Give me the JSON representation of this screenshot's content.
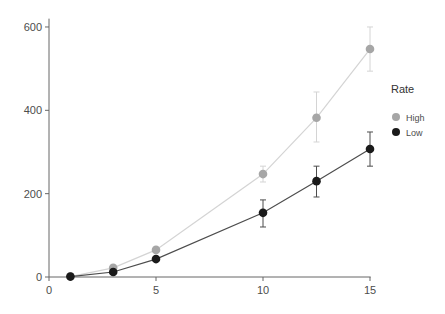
{
  "chart_data": {
    "type": "line",
    "title": "",
    "xlabel": "",
    "ylabel": "",
    "xlim": [
      0,
      15.5
    ],
    "ylim": [
      0,
      620
    ],
    "x_ticks": [
      0,
      5,
      10,
      15
    ],
    "y_ticks": [
      0,
      200,
      400,
      600
    ],
    "grid": false,
    "legend": {
      "title": "Rate",
      "position": "right"
    },
    "x": [
      1,
      3,
      5,
      10,
      12.5,
      15
    ],
    "series": [
      {
        "name": "High",
        "color": "#a6a6a6",
        "line_color": "#d4d4d4",
        "values": [
          1,
          22,
          65,
          247,
          382,
          547
        ],
        "error_low": [
          1,
          18,
          60,
          228,
          324,
          494
        ],
        "error_high": [
          1,
          26,
          70,
          266,
          444,
          600
        ]
      },
      {
        "name": "Low",
        "color": "#1a1a1a",
        "line_color": "#4d4d4d",
        "values": [
          1,
          12,
          43,
          154,
          230,
          307
        ],
        "error_low": [
          1,
          10,
          40,
          120,
          192,
          266
        ],
        "error_high": [
          1,
          14,
          46,
          185,
          266,
          348
        ]
      }
    ]
  }
}
